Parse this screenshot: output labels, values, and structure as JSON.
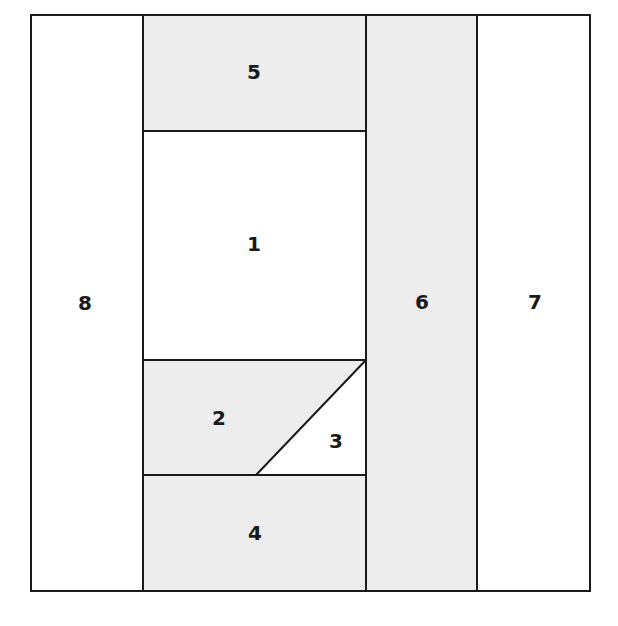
{
  "figure": {
    "canvas": {
      "width": 618,
      "height": 626
    },
    "frame": {
      "x0": 31,
      "y0": 15,
      "x1": 590,
      "y1": 591
    },
    "colors": {
      "shaded_fill": "#ededed",
      "plain_fill": "#ffffff",
      "stroke": "#1a1a1a",
      "label_color": "#1a1a1a",
      "background": "#ffffff"
    },
    "stroke_width": 2
  },
  "chart_data": {
    "type": "diagram",
    "xlabel": "",
    "ylabel": "",
    "xlim": [
      31,
      590
    ],
    "ylim": [
      15,
      591
    ],
    "grid": false,
    "legend": "none",
    "guide_lines": {
      "vertical_dividers_x": [
        143,
        366,
        477
      ],
      "horizontal_dividers_y": [
        131,
        360,
        475
      ],
      "diagonal": {
        "from": [
          257,
          474
        ],
        "to": [
          366,
          360
        ]
      }
    },
    "regions": [
      {
        "id": "region-1",
        "label": "1",
        "shaded": false,
        "fill": "#ffffff",
        "label_x": 254,
        "label_y": 245,
        "points": "143,131 366,131 366,360 143,360",
        "bounds": {
          "x0": 143,
          "y0": 131,
          "x1": 366,
          "y1": 360
        },
        "shape": "rectangle"
      },
      {
        "id": "region-2",
        "label": "2",
        "shaded": true,
        "fill": "#ededed",
        "label_x": 219,
        "label_y": 419,
        "points": "143,360 366,360 257,474 143,474",
        "bounds": {
          "x0": 143,
          "y0": 360,
          "x1": 366,
          "y1": 474
        },
        "shape": "trapezoid"
      },
      {
        "id": "region-3",
        "label": "3",
        "shaded": false,
        "fill": "#ffffff",
        "label_x": 336,
        "label_y": 442,
        "points": "366,360 366,474 257,474",
        "bounds": {
          "x0": 257,
          "y0": 360,
          "x1": 366,
          "y1": 474
        },
        "shape": "triangle"
      },
      {
        "id": "region-4",
        "label": "4",
        "shaded": true,
        "fill": "#ededed",
        "label_x": 255,
        "label_y": 534,
        "points": "143,475 366,475 366,591 143,591",
        "bounds": {
          "x0": 143,
          "y0": 475,
          "x1": 366,
          "y1": 591
        },
        "shape": "rectangle"
      },
      {
        "id": "region-5",
        "label": "5",
        "shaded": true,
        "fill": "#ededed",
        "label_x": 254,
        "label_y": 73,
        "points": "143,15 366,15 366,131 143,131",
        "bounds": {
          "x0": 143,
          "y0": 15,
          "x1": 366,
          "y1": 131
        },
        "shape": "rectangle"
      },
      {
        "id": "region-6",
        "label": "6",
        "shaded": true,
        "fill": "#ededed",
        "label_x": 422,
        "label_y": 303,
        "points": "366,15 477,15 477,591 366,591",
        "bounds": {
          "x0": 366,
          "y0": 15,
          "x1": 477,
          "y1": 591
        },
        "shape": "rectangle"
      },
      {
        "id": "region-7",
        "label": "7",
        "shaded": false,
        "fill": "#ffffff",
        "label_x": 535,
        "label_y": 303,
        "points": "477,15 590,15 590,591 477,591",
        "bounds": {
          "x0": 477,
          "y0": 15,
          "x1": 590,
          "y1": 591
        },
        "shape": "rectangle"
      },
      {
        "id": "region-8",
        "label": "8",
        "shaded": false,
        "fill": "#ffffff",
        "label_x": 85,
        "label_y": 304,
        "points": "31,15 143,15 143,591 31,591",
        "bounds": {
          "x0": 31,
          "y0": 15,
          "x1": 143,
          "y1": 591
        },
        "shape": "rectangle"
      }
    ]
  }
}
